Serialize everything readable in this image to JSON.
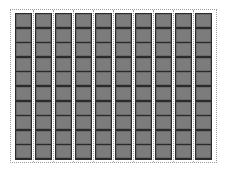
{
  "sheet": {
    "columns": 10,
    "rows_per_column": 10,
    "colors": {
      "background": "#ffffff",
      "frame": "#2b2b2b",
      "cell": "#7c7c7c",
      "dotted_line": "#9a9a9a"
    }
  }
}
